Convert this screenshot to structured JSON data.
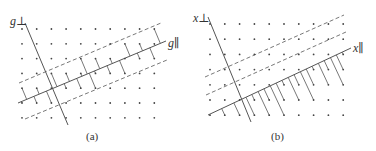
{
  "figure": {
    "panels": [
      {
        "id": "a",
        "caption": "(a)",
        "perp_axis_label": "g⊥",
        "par_axis_label": "g∥",
        "band_type": "symmetric",
        "lattice": {
          "rows": 7,
          "cols": 10
        },
        "connectors": "projection lines from lattice points inside the band to the parallel axis"
      },
      {
        "id": "b",
        "caption": "(b)",
        "perp_axis_label": "x⊥",
        "par_axis_label": "x∥",
        "band_type": "one-sided",
        "lattice": {
          "rows": 7,
          "cols": 10
        },
        "connectors": "projection lines from lattice points inside the band to the parallel axis"
      }
    ],
    "colors": {
      "line": "#555555",
      "dot": "#444444",
      "text": "#333333"
    }
  }
}
